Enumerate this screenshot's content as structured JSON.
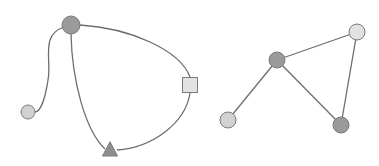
{
  "colors": {
    "background": "#ffffff",
    "edge": "#6e6e6e",
    "node_dark": "#9a9a9a",
    "node_light": "#d2d2d2",
    "node_lighter": "#e2e2e2",
    "node_stroke": "#7a7a7a"
  },
  "graphs": [
    {
      "name": "curved-graph",
      "nodes": [
        {
          "id": "hub",
          "shape": "circle",
          "x": 71,
          "y": 25,
          "r": 9,
          "fill": "#9a9a9a"
        },
        {
          "id": "leaf",
          "shape": "circle",
          "x": 28,
          "y": 112,
          "r": 7,
          "fill": "#d2d2d2"
        },
        {
          "id": "square",
          "shape": "square",
          "x": 190,
          "y": 85,
          "size": 15,
          "fill": "#e2e2e2"
        },
        {
          "id": "triangle",
          "shape": "triangle",
          "x": 110,
          "y": 150,
          "size": 15,
          "fill": "#8e8e8e"
        }
      ],
      "edges": [
        {
          "from": "hub",
          "to": "leaf",
          "path": "M64,27 C40,35 52,60 48,80 C45,100 40,112 35,112"
        },
        {
          "from": "hub",
          "to": "square",
          "path": "M80,25 C130,28 180,50 190,77"
        },
        {
          "from": "hub",
          "to": "triangle",
          "path": "M71,34 C72,80 85,130 105,149"
        },
        {
          "from": "square",
          "to": "triangle",
          "path": "M190,93 C185,125 150,148 117,150"
        }
      ]
    },
    {
      "name": "straight-graph",
      "nodes": [
        {
          "id": "center",
          "shape": "circle",
          "x": 277,
          "y": 60,
          "r": 8,
          "fill": "#9a9a9a"
        },
        {
          "id": "top-right",
          "shape": "circle",
          "x": 357,
          "y": 32,
          "r": 8,
          "fill": "#e2e2e2"
        },
        {
          "id": "bottom-right",
          "shape": "circle",
          "x": 341,
          "y": 125,
          "r": 8,
          "fill": "#9a9a9a"
        },
        {
          "id": "bottom-left",
          "shape": "circle",
          "x": 228,
          "y": 120,
          "r": 8,
          "fill": "#d2d2d2"
        }
      ],
      "edges": [
        {
          "from": "center",
          "to": "top-right"
        },
        {
          "from": "center",
          "to": "bottom-right"
        },
        {
          "from": "center",
          "to": "bottom-left"
        },
        {
          "from": "top-right",
          "to": "bottom-right"
        }
      ]
    }
  ]
}
